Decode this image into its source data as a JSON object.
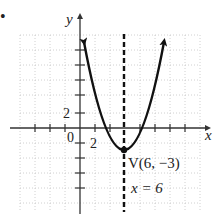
{
  "figure": {
    "bullet": "•",
    "axes": {
      "x_label": "x",
      "y_label": "y",
      "origin_label": "0",
      "x_tick_label": "2",
      "y_tick_label": "2",
      "units_per_tick": 2
    },
    "curve": {
      "type": "parabola",
      "equation": "y = (1/2)(x - 6)^2 - 3",
      "opens": "up"
    },
    "vertex": {
      "label": "V(6, −3)",
      "x": 6,
      "y": -3
    },
    "axis_of_symmetry": {
      "label": "x = 6",
      "x": 6,
      "style": "dashed"
    },
    "colors": {
      "curve": "#111111",
      "grid": "#bbbbbb",
      "axis": "#333333"
    }
  }
}
